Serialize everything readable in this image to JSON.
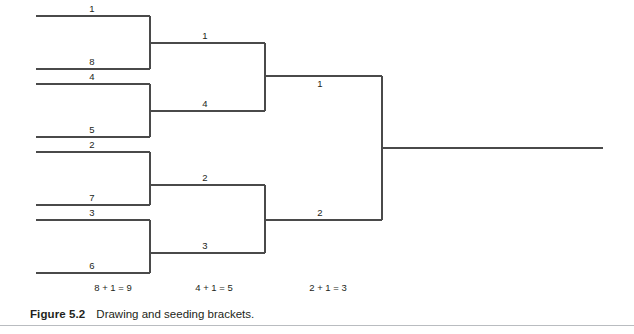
{
  "figure": {
    "caption_label": "Figure 5.2",
    "caption_text": "Drawing and seeding brackets."
  },
  "bracket": {
    "title": "Eight-team single elimination seeding bracket",
    "rounds": [
      {
        "name": "round-of-eight",
        "formula": "8 + 1 = 9",
        "formula_x": 113,
        "x_start": 36,
        "x_end": 150,
        "label_x": 92,
        "label_below": false,
        "slots": [
          {
            "seed": "1",
            "y": 16
          },
          {
            "seed": "8",
            "y": 69
          },
          {
            "seed": "4",
            "y": 84
          },
          {
            "seed": "5",
            "y": 137
          },
          {
            "seed": "2",
            "y": 152
          },
          {
            "seed": "7",
            "y": 205
          },
          {
            "seed": "3",
            "y": 220
          },
          {
            "seed": "6",
            "y": 273
          }
        ]
      },
      {
        "name": "semifinals",
        "formula": "4 + 1 = 5",
        "formula_x": 214,
        "x_start": 150,
        "x_end": 265,
        "label_x": 205,
        "label_below": false,
        "slots": [
          {
            "seed": "1",
            "y": 43
          },
          {
            "seed": "4",
            "y": 111
          },
          {
            "seed": "2",
            "y": 185
          },
          {
            "seed": "3",
            "y": 253
          }
        ]
      },
      {
        "name": "finals",
        "formula": "2 + 1 = 3",
        "formula_x": 328,
        "x_start": 265,
        "x_end": 382,
        "label_x": 320,
        "label_below": false,
        "slots": [
          {
            "seed": "1",
            "y": 76,
            "below": true
          },
          {
            "seed": "2",
            "y": 220
          }
        ]
      }
    ],
    "champion_line": {
      "x_start": 382,
      "x_end": 603,
      "y": 148
    },
    "formula_y": 283,
    "line_color": "#4a4a4a",
    "rule_color": "#b9bcc0"
  }
}
